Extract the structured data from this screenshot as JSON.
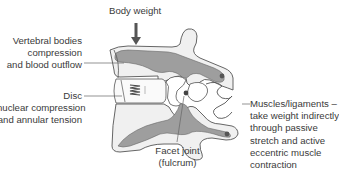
{
  "diagram": {
    "type": "anatomical-diagram",
    "colors": {
      "bone_fill": "#f0f0f0",
      "cortical_fill": "#9e9e9e",
      "outline": "#555555",
      "label_text": "#3a3a3a",
      "arrow": "#555555"
    },
    "labels": {
      "body_weight": "Body weight",
      "vertebral_bodies": {
        "line1": "Vertebral bodies",
        "line2": "compression",
        "line3": "and blood outflow"
      },
      "disc": {
        "line1": "Disc",
        "line2": "nuclear compression",
        "line3": "and annular tension"
      },
      "facet_joint": {
        "line1": "Facet joint",
        "line2": "(fulcrum)"
      },
      "muscles_ligaments": {
        "line1": "Muscles/ligaments –",
        "line2": "take weight indirectly",
        "line3": "through passive",
        "line4": "stretch and active",
        "line5": "eccentric muscle",
        "line6": "contraction"
      }
    }
  }
}
